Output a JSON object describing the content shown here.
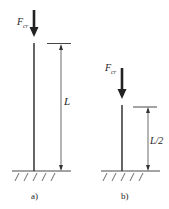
{
  "figure": {
    "a": {
      "force_label": "F",
      "force_subscript": "cr",
      "length_label": "L",
      "caption": "a)"
    },
    "b": {
      "force_label": "F",
      "force_subscript": "cr",
      "length_label": "L/2",
      "caption": "b)"
    }
  },
  "colors": {
    "line": "#333333",
    "column": "#555555"
  }
}
